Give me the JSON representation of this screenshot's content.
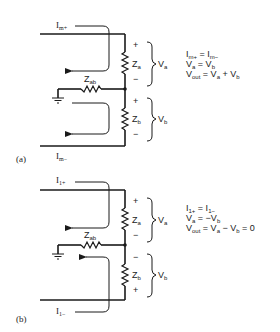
{
  "figure": {
    "panels": [
      {
        "label": "(a)",
        "current_top": {
          "main": "I",
          "sub": "m+"
        },
        "current_bottom": {
          "main": "I",
          "sub": "m−"
        },
        "impedances": {
          "za": {
            "main": "Z",
            "sub": "a"
          },
          "zb": {
            "main": "Z",
            "sub": "b"
          },
          "zab": {
            "main": "Z",
            "sub": "ab"
          }
        },
        "za_signs": {
          "top": "+",
          "bottom": "−"
        },
        "zb_signs": {
          "top": "+",
          "bottom": "−"
        },
        "voltages": {
          "va": {
            "main": "V",
            "sub": "a"
          },
          "vb": {
            "main": "V",
            "sub": "b"
          }
        },
        "equations": [
          {
            "parts": [
              {
                "t": "I"
              },
              {
                "s": "m+"
              },
              {
                "t": " = I"
              },
              {
                "s": "m−"
              }
            ]
          },
          {
            "parts": [
              {
                "t": "V"
              },
              {
                "s": "a"
              },
              {
                "t": " = V"
              },
              {
                "s": "b"
              }
            ]
          },
          {
            "parts": [
              {
                "t": "V"
              },
              {
                "s": "out"
              },
              {
                "t": " = V"
              },
              {
                "s": "a"
              },
              {
                "t": " + V"
              },
              {
                "s": "b"
              }
            ]
          }
        ]
      },
      {
        "label": "(b)",
        "current_top": {
          "main": "I",
          "sub": "1+"
        },
        "current_bottom": {
          "main": "I",
          "sub": "1−"
        },
        "impedances": {
          "za": {
            "main": "Z",
            "sub": "a"
          },
          "zb": {
            "main": "Z",
            "sub": "b"
          },
          "zab": {
            "main": "Z",
            "sub": "ab"
          }
        },
        "za_signs": {
          "top": "+",
          "bottom": "−"
        },
        "zb_signs": {
          "top": "−",
          "bottom": "+"
        },
        "voltages": {
          "va": {
            "main": "V",
            "sub": "a"
          },
          "vb": {
            "main": "V",
            "sub": "b"
          }
        },
        "equations": [
          {
            "parts": [
              {
                "t": "I"
              },
              {
                "s": "1+"
              },
              {
                "t": " = I"
              },
              {
                "s": "1−"
              }
            ]
          },
          {
            "parts": [
              {
                "t": "V"
              },
              {
                "s": "a"
              },
              {
                "t": " = −V"
              },
              {
                "s": "b"
              }
            ]
          },
          {
            "parts": [
              {
                "t": "V"
              },
              {
                "s": "out"
              },
              {
                "t": " = V"
              },
              {
                "s": "a"
              },
              {
                "t": " − V"
              },
              {
                "s": "b"
              },
              {
                "t": " = 0"
              }
            ]
          }
        ]
      }
    ]
  }
}
